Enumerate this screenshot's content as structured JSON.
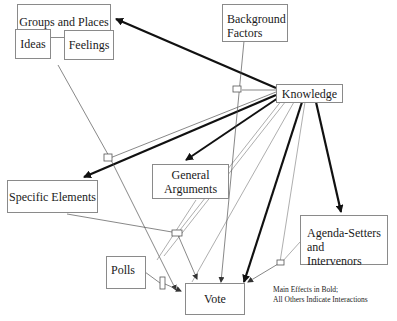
{
  "diagram": {
    "nodes": {
      "groups_places": "Groups and Places",
      "ideas": "Ideas",
      "feelings": "Feelings",
      "background_factors_line1": "Background",
      "background_factors_line2": "Factors",
      "knowledge": "Knowledge",
      "general_arguments_line1": "General",
      "general_arguments_line2": "Arguments",
      "specific_elements": "Specific Elements",
      "agenda_setters_line1": "Agenda-Setters and",
      "agenda_setters_line2": "Intervenors",
      "polls": "Polls",
      "vote": "Vote"
    },
    "legend": {
      "line1": "Main Effects in Bold;",
      "line2": "All Others Indicate Interactions"
    },
    "edges": [
      {
        "from": "Knowledge",
        "to": "Groups and Places",
        "style": "bold"
      },
      {
        "from": "Knowledge",
        "to": "Specific Elements",
        "style": "bold"
      },
      {
        "from": "Knowledge",
        "to": "General Arguments",
        "style": "bold"
      },
      {
        "from": "Knowledge",
        "to": "Agenda-Setters and Intervenors",
        "style": "bold"
      },
      {
        "from": "Knowledge",
        "to": "Vote",
        "style": "bold"
      },
      {
        "from": "Background Factors",
        "to": "Vote",
        "style": "thin"
      },
      {
        "from": "Ideas/Feelings",
        "to": "Vote",
        "style": "thin"
      },
      {
        "from": "Specific Elements",
        "to": "Vote",
        "style": "thin"
      },
      {
        "from": "Polls",
        "to": "Vote",
        "style": "thin"
      },
      {
        "from": "Agenda-Setters and Intervenors",
        "to": "Vote",
        "style": "thin"
      }
    ]
  }
}
